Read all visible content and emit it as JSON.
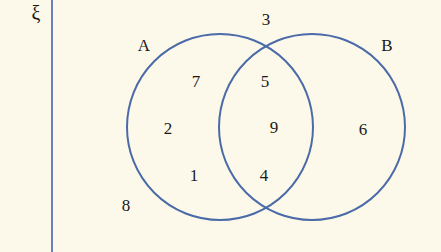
{
  "diagram": {
    "type": "venn",
    "universal_set_symbol": "ξ",
    "sets": [
      {
        "name": "A",
        "label": "A"
      },
      {
        "name": "B",
        "label": "B"
      }
    ],
    "regions": {
      "A_only": [
        "7",
        "2",
        "1"
      ],
      "A_and_B": [
        "5",
        "9",
        "4"
      ],
      "B_only": [
        "6"
      ],
      "outside": [
        "3",
        "8"
      ]
    },
    "labels": {
      "xi": "ξ",
      "A": "A",
      "B": "B",
      "n7": "7",
      "n2": "2",
      "n1": "1",
      "n5": "5",
      "n9": "9",
      "n4": "4",
      "n6": "6",
      "n3": "3",
      "n8": "8"
    },
    "colors": {
      "background": "#fcf9ea",
      "circle_stroke": "#4a6aa8",
      "axis_line": "#6a80b8",
      "text": "#1a1a1a"
    }
  }
}
